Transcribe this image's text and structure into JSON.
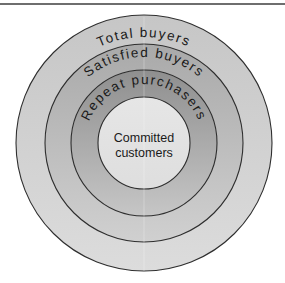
{
  "diagram": {
    "type": "concentric-circles",
    "rings": [
      {
        "label": "Total buyers",
        "radius": 128,
        "color": "#c9c9c9",
        "color_bottom": "#dadada",
        "text_radius": 113
      },
      {
        "label": "Satisfied buyers",
        "radius": 99,
        "color": "#adadad",
        "color_bottom": "#cfcfcf",
        "text_radius": 86
      },
      {
        "label": "Repeat purchasers",
        "radius": 73,
        "color": "#959595",
        "color_bottom": "#c4c4c4",
        "text_radius": 59
      }
    ],
    "core": {
      "line1": "Committed",
      "line2": "customers",
      "radius": 46,
      "color": "#e2e2e2"
    },
    "outline_color": "#2e2e2e",
    "rule_color": "#6e6e6e"
  }
}
